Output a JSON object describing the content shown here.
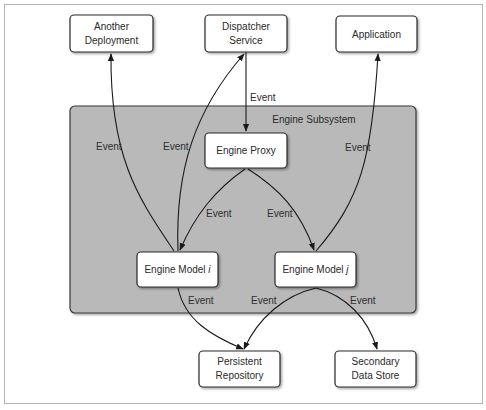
{
  "diagram": {
    "group": {
      "id": "engine-subsystem",
      "label": "Engine Subsystem",
      "fill": "#b8b8b8",
      "stroke": "#3a3a3a"
    },
    "nodes": {
      "another_deployment": {
        "line1": "Another",
        "line2": "Deployment"
      },
      "dispatcher_service": {
        "line1": "Dispatcher",
        "line2": "Service"
      },
      "application": {
        "label": "Application"
      },
      "engine_proxy": {
        "label": "Engine Proxy"
      },
      "engine_model_i": {
        "label": "Engine Model",
        "suffix": "i"
      },
      "engine_model_j": {
        "label": "Engine Model",
        "suffix": "j"
      },
      "persistent_repository": {
        "line1": "Persistent",
        "line2": "Repository"
      },
      "secondary_data_store": {
        "line1": "Secondary",
        "line2": "Data Store"
      }
    },
    "edges": [
      {
        "from": "Dispatcher Service",
        "to": "Engine Proxy",
        "label": "Event"
      },
      {
        "from": "Engine Model i",
        "to": "Another Deployment",
        "label": "Event"
      },
      {
        "from": "Engine Model i",
        "to": "Dispatcher Service",
        "label": "Event"
      },
      {
        "from": "Engine Model j",
        "to": "Application",
        "label": "Event"
      },
      {
        "from": "Engine Proxy",
        "to": "Engine Model i",
        "label": "Event"
      },
      {
        "from": "Engine Proxy",
        "to": "Engine Model j",
        "label": "Event"
      },
      {
        "from": "Engine Model i",
        "to": "Persistent Repository",
        "label": "Event"
      },
      {
        "from": "Engine Model j",
        "to": "Persistent Repository",
        "label": "Event"
      },
      {
        "from": "Engine Model j",
        "to": "Secondary Data Store",
        "label": "Event"
      }
    ],
    "edge_labels": {
      "dispatcher_to_proxy": "Event",
      "model_i_to_another": "Event",
      "model_i_to_dispatcher": "Event",
      "model_j_to_application": "Event",
      "proxy_to_model_i": "Event",
      "proxy_to_model_j": "Event",
      "model_i_to_repo": "Event",
      "model_j_to_repo": "Event",
      "model_j_to_store": "Event"
    },
    "colors": {
      "node_fill": "#ffffff",
      "node_stroke": "#2a2a2a",
      "edge": "#1a1a1a",
      "frame": "#b5b5b5"
    }
  }
}
